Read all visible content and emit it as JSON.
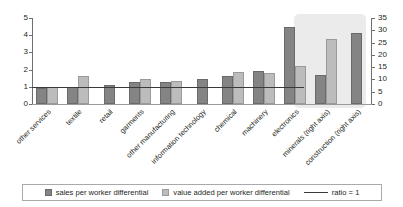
{
  "chart_data": {
    "type": "bar",
    "title": "",
    "subtitle": "",
    "xlabel": "",
    "ylabel": "",
    "categories": [
      "other services",
      "textile",
      "retail",
      "garments",
      "other manufacturing",
      "information technology",
      "chemical",
      "machinery",
      "electronics",
      "minerals (right axis)",
      "construction (right axis)"
    ],
    "series": [
      {
        "name": "sales per worker differential",
        "color": "#848484",
        "values": [
          0.95,
          1.0,
          1.1,
          1.27,
          1.3,
          1.47,
          1.65,
          1.9,
          4.5,
          12.0,
          29.0
        ]
      },
      {
        "name": "value added per worker differential",
        "color": "#bcbcbc",
        "values": [
          1.0,
          1.65,
          null,
          1.43,
          1.33,
          null,
          1.85,
          1.8,
          2.2,
          26.5,
          null
        ]
      }
    ],
    "reference_line": {
      "label": "ratio = 1",
      "value": 1,
      "color": "#3a3a3a"
    },
    "axis_assignment": [
      "left",
      "left",
      "left",
      "left",
      "left",
      "left",
      "left",
      "left",
      "left",
      "right",
      "right"
    ],
    "left_axis": {
      "ticks": [
        "0",
        "1",
        "2",
        "3",
        "4",
        "5"
      ],
      "ylim": [
        0,
        5
      ]
    },
    "right_axis": {
      "ticks": [
        "0",
        "5",
        "10",
        "15",
        "20",
        "25",
        "30",
        "35"
      ],
      "ylim": [
        0,
        35
      ]
    },
    "highlight_region": {
      "label": "right-axis categories",
      "categories": [
        "minerals (right axis)",
        "construction (right axis)"
      ],
      "color": "#ebebeb"
    },
    "grid": false,
    "legend_position": "bottom"
  },
  "legend": {
    "items": [
      {
        "label": "sales per worker differential",
        "marker": "dark-swatch"
      },
      {
        "label": "value added per worker differential",
        "marker": "light-swatch"
      },
      {
        "label": "ratio = 1",
        "marker": "line"
      }
    ]
  },
  "clipped_header": ""
}
